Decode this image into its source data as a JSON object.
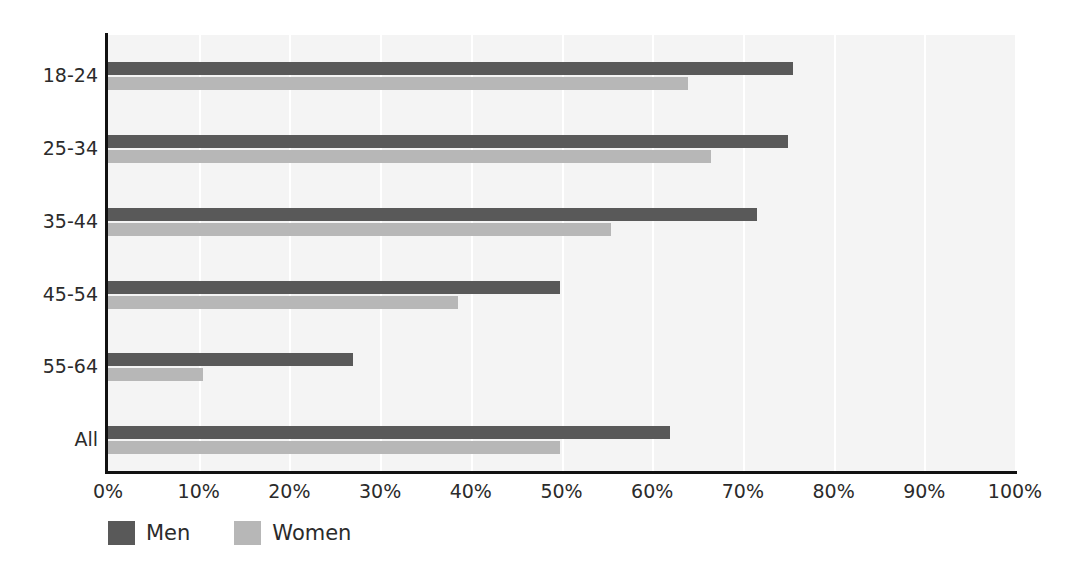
{
  "chart_data": {
    "type": "bar",
    "orientation": "horizontal",
    "title": "",
    "subtitle": "",
    "xlabel": "",
    "ylabel": "",
    "xlim": [
      0,
      100
    ],
    "xtick_labels": [
      "0%",
      "10%",
      "20%",
      "30%",
      "40%",
      "50%",
      "60%",
      "70%",
      "80%",
      "90%",
      "100%"
    ],
    "xticks": [
      0,
      10,
      20,
      30,
      40,
      50,
      60,
      70,
      80,
      90,
      100
    ],
    "categories": [
      "18-24",
      "25-34",
      "35-44",
      "45-54",
      "55-64",
      "All"
    ],
    "grid": "vertical",
    "legend_position": "bottom-left",
    "series": [
      {
        "name": "Men",
        "color": "#595959",
        "values": [
          75.5,
          75.0,
          71.5,
          49.8,
          27.0,
          62.0
        ]
      },
      {
        "name": "Women",
        "color": "#b7b7b7",
        "values": [
          64.0,
          66.5,
          55.5,
          38.6,
          10.5,
          49.8
        ]
      }
    ]
  },
  "legend": {
    "items": [
      {
        "label": "Men",
        "color": "#595959",
        "swatch_name": "legend-swatch-men"
      },
      {
        "label": "Women",
        "color": "#b7b7b7",
        "swatch_name": "legend-swatch-women"
      }
    ]
  },
  "colors": {
    "plot_background": "#f4f4f4",
    "gridline": "#ffffff",
    "axis": "#111111",
    "text": "#2b2b2b",
    "men": "#595959",
    "women": "#b7b7b7"
  }
}
